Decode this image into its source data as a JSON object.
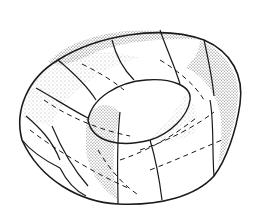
{
  "figure": {
    "colors": {
      "background": "#ffffff",
      "stroke": "#1a1a1a",
      "stipple": "#333333"
    }
  }
}
